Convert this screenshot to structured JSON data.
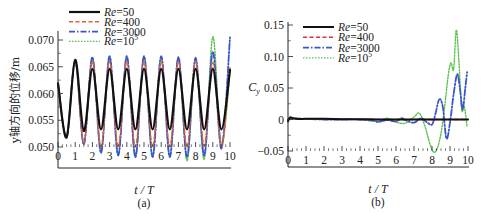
{
  "chart_data": [
    {
      "type": "line",
      "panel_label": "(a)",
      "title": "",
      "xlabel": "t / T",
      "ylabel": "y轴方向的位移/m",
      "xlim": [
        0,
        10
      ],
      "ylim": [
        0.0476,
        0.0715
      ],
      "xticks": [
        0,
        1,
        2,
        3,
        4,
        5,
        6,
        7,
        8,
        9,
        10
      ],
      "xtick_labels": [
        "0",
        "1",
        "2",
        "3",
        "4",
        "5",
        "6",
        "7",
        "8",
        "9",
        "10"
      ],
      "yticks": [
        0.05,
        0.055,
        0.06,
        0.065,
        0.07
      ],
      "ytick_labels": [
        "0.050",
        "0.055",
        "0.060",
        "0.065",
        "0.070"
      ],
      "grid": false,
      "legend_position": "upper left (above plot)",
      "series": [
        {
          "name": "Re=50",
          "name_prefix": "Re",
          "name_suffix": "=50",
          "color": "#111111",
          "dash": "",
          "width": 2.2,
          "x": [
            0,
            0.5,
            1.0,
            1.5,
            2.0,
            2.5,
            3.0,
            3.5,
            4.0,
            4.5,
            5.0,
            5.5,
            6.0,
            6.5,
            7.0,
            7.5,
            8.0,
            8.5,
            9.0,
            9.5,
            10.0
          ],
          "y": [
            0.0619,
            0.0518,
            0.0663,
            0.053,
            0.0646,
            0.0533,
            0.0646,
            0.0533,
            0.0646,
            0.0533,
            0.0646,
            0.0533,
            0.0646,
            0.0533,
            0.0646,
            0.0533,
            0.0646,
            0.0533,
            0.0646,
            0.0533,
            0.0644
          ]
        },
        {
          "name": "Re=400",
          "name_prefix": "Re",
          "name_suffix": "=400",
          "color": "#e0603a",
          "dash": "4,2.5",
          "width": 1.4,
          "x": [
            0,
            0.5,
            1.0,
            1.5,
            2.0,
            2.5,
            3.0,
            3.5,
            4.0,
            4.5,
            5.0,
            5.5,
            6.0,
            6.5,
            7.0,
            7.5,
            8.0,
            8.5,
            9.0,
            9.5,
            10.0
          ],
          "y": [
            0.0619,
            0.0518,
            0.0662,
            0.0508,
            0.066,
            0.05,
            0.066,
            0.05,
            0.066,
            0.05,
            0.066,
            0.05,
            0.066,
            0.05,
            0.066,
            0.05,
            0.066,
            0.0502,
            0.0658,
            0.0502,
            0.0648
          ]
        },
        {
          "name": "Re=3000",
          "name_prefix": "Re",
          "name_suffix": "=3000",
          "color": "#3a56c8",
          "dash": "6,2,1.5,2",
          "width": 1.8,
          "x": [
            0,
            0.5,
            1.0,
            1.5,
            2.0,
            2.5,
            3.0,
            3.5,
            4.0,
            4.5,
            5.0,
            5.5,
            6.0,
            6.5,
            7.0,
            7.5,
            8.0,
            8.5,
            9.0,
            9.5,
            10.0
          ],
          "y": [
            0.0619,
            0.0518,
            0.0662,
            0.0505,
            0.0668,
            0.0489,
            0.067,
            0.0484,
            0.067,
            0.0481,
            0.067,
            0.0481,
            0.067,
            0.0481,
            0.0668,
            0.0481,
            0.0667,
            0.0484,
            0.0678,
            0.0497,
            0.0705
          ]
        },
        {
          "name": "Re=10^5",
          "name_prefix": "Re",
          "name_suffix": "=10",
          "name_sup": "5",
          "color": "#5cc24a",
          "dash": "1.5,1.5",
          "width": 1.4,
          "x": [
            0,
            0.5,
            1.0,
            1.5,
            2.0,
            2.5,
            3.0,
            3.5,
            4.0,
            4.5,
            5.0,
            5.5,
            6.0,
            6.5,
            7.0,
            7.5,
            8.0,
            8.5,
            9.0,
            9.5,
            10.0
          ],
          "y": [
            0.0619,
            0.0518,
            0.0662,
            0.0506,
            0.0666,
            0.0493,
            0.0668,
            0.0486,
            0.0668,
            0.0483,
            0.0668,
            0.0484,
            0.0668,
            0.0484,
            0.0666,
            0.0474,
            0.0664,
            0.0477,
            0.0706,
            0.0505,
            0.064
          ]
        }
      ]
    },
    {
      "type": "line",
      "panel_label": "(b)",
      "title": "",
      "xlabel": "t / T",
      "ylabel": "C_y",
      "ylabel_main": "C",
      "ylabel_sub": "y",
      "xlim": [
        0,
        10
      ],
      "ylim": [
        -0.075,
        0.155
      ],
      "xticks": [
        0,
        1,
        2,
        3,
        4,
        5,
        6,
        7,
        8,
        9,
        10
      ],
      "xtick_labels": [
        "0",
        "1",
        "2",
        "3",
        "4",
        "5",
        "6",
        "7",
        "8",
        "9",
        "10"
      ],
      "yticks": [
        -0.05,
        0,
        0.05,
        0.1,
        0.15
      ],
      "ytick_labels": [
        "−0.05",
        "0",
        "0.05",
        "0.10",
        "0.15"
      ],
      "grid": false,
      "legend_position": "upper left",
      "series": [
        {
          "name": "Re=50",
          "name_prefix": "Re",
          "name_suffix": "=50",
          "color": "#111111",
          "dash": "",
          "width": 2.0,
          "x": [
            0,
            0.1,
            0.2,
            0.4,
            1,
            2,
            3,
            4,
            5,
            6,
            7,
            8,
            9,
            10
          ],
          "y": [
            -0.003,
            0.003,
            0.003,
            0.001,
            0.001,
            0.001,
            0.0005,
            0.0005,
            0.0,
            0.0,
            0.0,
            0.0,
            0.0,
            0.0
          ]
        },
        {
          "name": "Re=400",
          "name_prefix": "Re",
          "name_suffix": "=400",
          "color": "#e0303a",
          "dash": "4,2.5",
          "width": 1.4,
          "x": [
            0,
            0.1,
            0.2,
            1,
            2,
            3,
            4,
            5,
            6,
            7,
            8,
            9,
            10
          ],
          "y": [
            -0.003,
            0.003,
            0.002,
            0.001,
            0.0005,
            0.0005,
            0.0,
            0.0,
            0.0,
            0.0,
            0.0,
            0.0,
            0.0
          ]
        },
        {
          "name": "Re=3000",
          "name_prefix": "Re",
          "name_suffix": "=3000",
          "color": "#3a56c8",
          "dash": "6,2,1.5,2",
          "width": 1.8,
          "x": [
            0,
            0.2,
            1,
            2,
            3,
            4,
            4.8,
            5.0,
            5.5,
            6.0,
            6.3,
            6.6,
            7.0,
            7.4,
            7.7,
            8.0,
            8.2,
            8.4,
            8.6,
            8.8,
            9.0,
            9.2,
            9.4,
            9.55,
            9.7,
            9.85,
            9.95
          ],
          "y": [
            0,
            0.002,
            0.001,
            0.0,
            0.0,
            0.0,
            -0.002,
            -0.004,
            -0.001,
            -0.003,
            0.002,
            -0.002,
            -0.005,
            0.002,
            -0.004,
            -0.008,
            0.01,
            0.032,
            0.02,
            -0.03,
            -0.005,
            0.04,
            0.072,
            0.05,
            0.016,
            0.05,
            0.075
          ]
        },
        {
          "name": "Re=10^5",
          "name_prefix": "Re",
          "name_suffix": "=10",
          "name_sup": "5",
          "color": "#5cc24a",
          "dash": "1.5,1.5",
          "width": 1.4,
          "x": [
            0,
            0.2,
            1,
            2,
            3,
            4,
            5,
            5.5,
            6.0,
            6.5,
            7.0,
            7.3,
            7.6,
            7.9,
            8.1,
            8.3,
            8.5,
            8.7,
            8.9,
            9.05,
            9.2,
            9.35,
            9.5,
            9.65,
            9.8,
            9.95
          ],
          "y": [
            0,
            0.002,
            0.001,
            0.0,
            0.0,
            0.0,
            -0.003,
            0.002,
            -0.004,
            -0.006,
            0.004,
            0.01,
            -0.01,
            -0.04,
            -0.052,
            -0.045,
            -0.022,
            0.02,
            0.07,
            0.09,
            0.08,
            0.142,
            0.09,
            0.016,
            0.02,
            -0.012
          ]
        }
      ]
    }
  ]
}
